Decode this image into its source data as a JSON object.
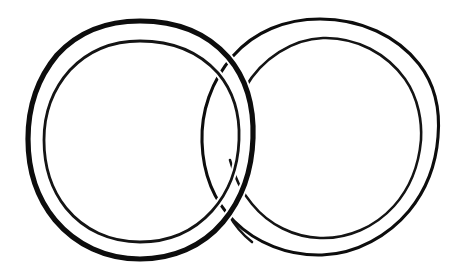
{
  "figure": {
    "style": "hand-drawn ink line drawing",
    "background_color": "#ffffff",
    "ink_color": "#0d0d0d",
    "canvas": {
      "width": 467,
      "height": 280
    },
    "shapes": [
      {
        "name": "left-ring",
        "label": "Left ring",
        "center_x": 140,
        "center_y": 140,
        "outer_radius": 113,
        "inner_radius": 96,
        "outer_stroke_width": 5.2,
        "inner_stroke_width": 2.6,
        "draw_order": "front",
        "occluded": false
      },
      {
        "name": "right-ring",
        "label": "Right ring",
        "center_x": 320,
        "center_y": 137,
        "outer_radius": 118,
        "inner_radius": 100,
        "outer_stroke_width": 3.1,
        "inner_stroke_width": 2.6,
        "draw_order": "back",
        "occluded": true,
        "occlusion_gap_start_y": 88,
        "occlusion_gap_end_y": 218
      }
    ],
    "crossings": [
      {
        "name": "upper-crossing",
        "x": 228,
        "y": 52,
        "over": "left-ring",
        "under": "right-ring"
      },
      {
        "name": "lower-crossing",
        "x": 232,
        "y": 228,
        "over": "left-ring",
        "under": "right-ring"
      }
    ]
  }
}
